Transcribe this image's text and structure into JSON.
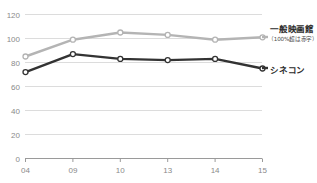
{
  "chart_data": {
    "type": "line",
    "title": "",
    "xlabel": "",
    "ylabel": "",
    "categories": [
      "04",
      "09",
      "10",
      "13",
      "14",
      "15"
    ],
    "ylim": [
      0,
      120
    ],
    "yticks": [
      0,
      20,
      40,
      60,
      80,
      100,
      120
    ],
    "grid": true,
    "legend_position": "right",
    "series": [
      {
        "name": "一般映画館",
        "sublabel": "（100%超は赤字）",
        "color": "#b4b4b4",
        "values": [
          85,
          99,
          105,
          103,
          99,
          101
        ]
      },
      {
        "name": "シネコン",
        "color": "#333333",
        "values": [
          72,
          87,
          83,
          82,
          83,
          75
        ]
      }
    ]
  },
  "axis": {
    "ytick_labels": [
      "120",
      "100",
      "80",
      "60",
      "40",
      "20",
      "0"
    ],
    "xtick_labels": [
      "04",
      "09",
      "10",
      "13",
      "14",
      "15"
    ]
  },
  "legend": {
    "general_theater_label": "一般映画館",
    "general_theater_note": "（100%超は赤字）",
    "cineplex_label": "シネコン"
  },
  "colors": {
    "series_general": "#b4b4b4",
    "series_cineplex": "#333333",
    "gridline": "#dcdcdc",
    "axis_text": "#8a8a8a",
    "legend_text": "#2b2b2b",
    "background": "#ffffff"
  }
}
